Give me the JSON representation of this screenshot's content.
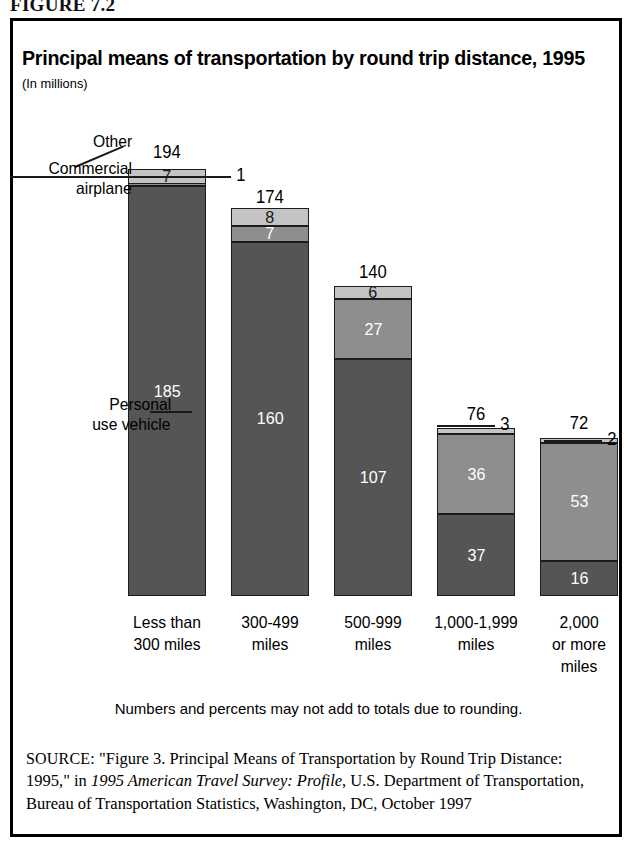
{
  "figure": {
    "label": "FIGURE 7.2",
    "title": "Principal means of transportation by round trip distance, 1995",
    "subtitle": "(In millions)",
    "note": "Numbers and percents may not add to totals due to rounding."
  },
  "callouts": {
    "other": "Other",
    "commercial_airplane_line1": "Commercial",
    "commercial_airplane_line2": "airplane",
    "personal_line1": "Personal",
    "personal_line2": "use vehicle"
  },
  "source": {
    "prefix": "SOURCE:",
    "text_before_italic": " \"Figure 3. Principal Means of Transportation by Round Trip Distance: 1995,\" in ",
    "italic": "1995 American Travel Survey: Profile",
    "text_after_italic": ", U.S. Department of Transportation, Bureau of Transportation Statistics, Washington, DC, October 1997"
  },
  "colors": {
    "personal_use_vehicle": "#555555",
    "commercial_airplane": "#8e8e8e",
    "other": "#c4c4c4",
    "outline": "#1c1c1c",
    "frame": "#000000"
  },
  "chart_data": {
    "type": "bar",
    "stacked": true,
    "title": "Principal means of transportation by round trip distance, 1995",
    "subtitle": "(In millions)",
    "xlabel": "",
    "ylabel": "Millions of round trips",
    "grid": false,
    "legend": "callout-annotations",
    "ylim": [
      0,
      194
    ],
    "categories": [
      "Less than 300 miles",
      "300-499 miles",
      "500-999 miles",
      "1,000-1,999 miles",
      "2,000 or more miles"
    ],
    "category_label_lines": [
      [
        "Less than",
        "300 miles"
      ],
      [
        "300-499",
        "miles"
      ],
      [
        "500-999",
        "miles"
      ],
      [
        "1,000-1,999",
        "miles"
      ],
      [
        "2,000",
        "or more",
        "miles"
      ]
    ],
    "series": [
      {
        "name": "Personal use vehicle",
        "values": [
          185,
          160,
          107,
          37,
          16
        ]
      },
      {
        "name": "Commercial airplane",
        "values": [
          1,
          7,
          27,
          36,
          53
        ]
      },
      {
        "name": "Other",
        "values": [
          7,
          8,
          6,
          3,
          2
        ]
      }
    ],
    "totals": [
      194,
      174,
      140,
      76,
      72
    ],
    "external_labels": [
      {
        "category": "Less than 300 miles",
        "series": "Commercial airplane",
        "value": 1
      },
      {
        "category": "1,000-1,999 miles",
        "series": "Other",
        "value": 3
      },
      {
        "category": "2,000 or more miles",
        "series": "Other",
        "value": 2
      }
    ]
  }
}
